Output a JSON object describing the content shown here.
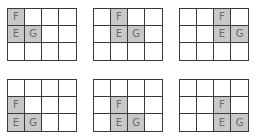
{
  "diagram": {
    "grid_size": {
      "cols": 4,
      "rows": 3
    },
    "fill_color": "#c8c8c8",
    "line_color": "#3a3a3a",
    "label_color": "#6a6a6a",
    "panels": [
      {
        "id": 1,
        "x": 7,
        "y": 8,
        "cells": [
          {
            "r": 0,
            "c": 0,
            "label": "F"
          },
          {
            "r": 1,
            "c": 0,
            "label": "E"
          },
          {
            "r": 1,
            "c": 1,
            "label": "G"
          }
        ]
      },
      {
        "id": 2,
        "x": 93,
        "y": 8,
        "cells": [
          {
            "r": 0,
            "c": 1,
            "label": "F"
          },
          {
            "r": 1,
            "c": 1,
            "label": "E"
          },
          {
            "r": 1,
            "c": 2,
            "label": "G"
          }
        ]
      },
      {
        "id": 3,
        "x": 179,
        "y": 8,
        "cells": [
          {
            "r": 0,
            "c": 2,
            "label": "F"
          },
          {
            "r": 1,
            "c": 2,
            "label": "E"
          },
          {
            "r": 1,
            "c": 3,
            "label": "G"
          }
        ]
      },
      {
        "id": 4,
        "x": 7,
        "y": 79,
        "cells": [
          {
            "r": 1,
            "c": 0,
            "label": "F"
          },
          {
            "r": 2,
            "c": 0,
            "label": "E"
          },
          {
            "r": 2,
            "c": 1,
            "label": "G"
          }
        ]
      },
      {
        "id": 5,
        "x": 93,
        "y": 79,
        "cells": [
          {
            "r": 1,
            "c": 1,
            "label": "F"
          },
          {
            "r": 2,
            "c": 1,
            "label": "E"
          },
          {
            "r": 2,
            "c": 2,
            "label": "G"
          }
        ]
      },
      {
        "id": 6,
        "x": 179,
        "y": 79,
        "cells": [
          {
            "r": 1,
            "c": 2,
            "label": "F"
          },
          {
            "r": 2,
            "c": 2,
            "label": "E"
          },
          {
            "r": 2,
            "c": 3,
            "label": "G"
          }
        ]
      }
    ]
  }
}
